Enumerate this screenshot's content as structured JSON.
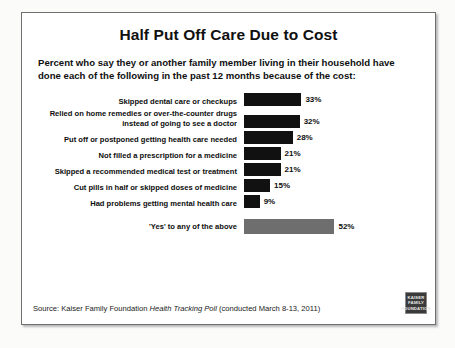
{
  "title": "Half Put Off Care Due to Cost",
  "subtitle": "Percent who say they or another family member living in their household have done each of the following in the past 12 months because of the cost:",
  "source": {
    "prefix": "Source: Kaiser Family Foundation ",
    "italic": "Health Tracking Poll",
    "suffix": " (conducted March 8-13, 2011)"
  },
  "logo": {
    "line1": "KAISER",
    "line2": "FAMILY",
    "line3": "FOUNDATION"
  },
  "chart_data": {
    "type": "bar",
    "orientation": "horizontal",
    "title": "Half Put Off Care Due to Cost",
    "subtitle": "Percent who say they or another family member living in their household have done each of the following in the past 12 months because of the cost:",
    "xlabel": "",
    "ylabel": "",
    "xlim": [
      0,
      55
    ],
    "grid": false,
    "legend": "none",
    "value_suffix": "%",
    "bar_colors": {
      "item": "#111111",
      "total": "#6e6e6e"
    },
    "categories": [
      "Skipped dental care or checkups",
      "Relied on home remedies or over-the-counter drugs instead of going to see a doctor",
      "Put off or postponed getting health care needed",
      "Not filled a prescription for a medicine",
      "Skipped a recommended medical test or treatment",
      "Cut pills in half or skipped doses of medicine",
      "Had problems getting mental health care",
      "'Yes' to any of the above"
    ],
    "values": [
      33,
      32,
      28,
      21,
      21,
      15,
      9,
      52
    ],
    "labels": [
      "33%",
      "32%",
      "28%",
      "21%",
      "21%",
      "15%",
      "9%",
      "52%"
    ],
    "bars": [
      {
        "label": "Skipped dental care or checkups",
        "value": 33,
        "display": "33%",
        "kind": "item"
      },
      {
        "label": "Relied on home remedies or over-the-counter drugs instead of going to see a doctor",
        "value": 32,
        "display": "32%",
        "kind": "item"
      },
      {
        "label": "Put off or postponed getting health care needed",
        "value": 28,
        "display": "28%",
        "kind": "item"
      },
      {
        "label": "Not filled a prescription for a medicine",
        "value": 21,
        "display": "21%",
        "kind": "item"
      },
      {
        "label": "Skipped a recommended medical test or treatment",
        "value": 21,
        "display": "21%",
        "kind": "item"
      },
      {
        "label": "Cut pills in half or skipped doses of medicine",
        "value": 15,
        "display": "15%",
        "kind": "item"
      },
      {
        "label": "Had problems getting mental health care",
        "value": 9,
        "display": "9%",
        "kind": "item"
      },
      {
        "label": "'Yes' to any of the above",
        "value": 52,
        "display": "52%",
        "kind": "total"
      }
    ]
  }
}
